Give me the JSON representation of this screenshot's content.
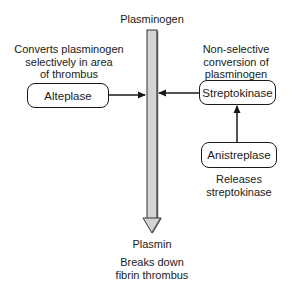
{
  "diagram": {
    "title_top": "Plasminogen",
    "title_bottom": "Plasmin",
    "outcome": [
      "Breaks down",
      "fibrin thrombus"
    ],
    "nodes": {
      "alteplase": {
        "label": "Alteplase",
        "description": [
          "Converts plasminogen",
          "selectively in area",
          "of thrombus"
        ]
      },
      "streptokinase": {
        "label": "Streptokinase",
        "description": [
          "Non-selective",
          "conversion of",
          "plasminogen"
        ]
      },
      "anistreplase": {
        "label": "Anistreplase",
        "description": [
          "Releases",
          "streptokinase"
        ]
      }
    },
    "edges": [
      {
        "from": "Alteplase",
        "to": "Plasminogen→Plasmin pathway"
      },
      {
        "from": "Streptokinase",
        "to": "Plasminogen→Plasmin pathway"
      },
      {
        "from": "Anistreplase",
        "to": "Streptokinase"
      },
      {
        "from": "Plasminogen",
        "to": "Plasmin"
      }
    ],
    "colors": {
      "line": "#1a1a1a",
      "shaft_fill": "#d4d4d4",
      "shaft_shadow": "#555555"
    }
  }
}
